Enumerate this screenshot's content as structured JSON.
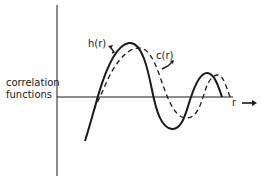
{
  "diagram": {
    "y_axis_label_line1": "correlation",
    "y_axis_label_line2": "functions",
    "x_axis_label": "r",
    "curves": [
      {
        "name": "h(r)",
        "style": "solid",
        "label": "h(r)"
      },
      {
        "name": "c(r)",
        "style": "dashed",
        "label": "c(r)"
      }
    ],
    "colors": {
      "ink": "#1a1a1a",
      "background": "#ffffff"
    }
  }
}
